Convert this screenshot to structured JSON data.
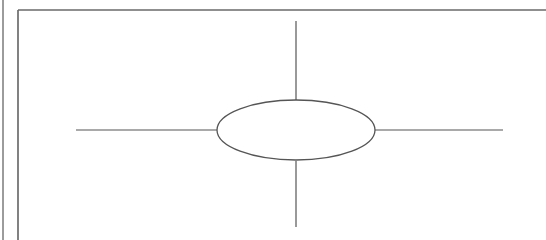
{
  "diagram": {
    "type": "spider-diagram",
    "colors": {
      "background": "#ffffff",
      "stroke": "#555555",
      "frame": "#6a6a6a"
    },
    "frame": {
      "outer_left_x": 3,
      "inner_left_x": 18,
      "inner_top_y": 10
    },
    "center_node": {
      "shape": "ellipse",
      "cx": 296,
      "cy": 130,
      "rx": 79,
      "ry": 30,
      "label": ""
    },
    "branches": [
      {
        "name": "branch-up",
        "x1": 296,
        "y1": 21,
        "x2": 296,
        "y2": 100,
        "label": ""
      },
      {
        "name": "branch-down",
        "x1": 296,
        "y1": 161,
        "x2": 296,
        "y2": 227,
        "label": ""
      },
      {
        "name": "branch-left",
        "x1": 76,
        "y1": 130,
        "x2": 217,
        "y2": 130,
        "label": ""
      },
      {
        "name": "branch-right",
        "x1": 375,
        "y1": 130,
        "x2": 503,
        "y2": 130,
        "label": ""
      }
    ]
  }
}
